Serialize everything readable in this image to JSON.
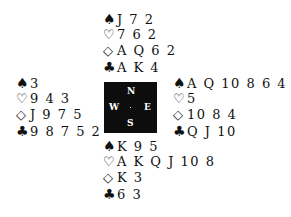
{
  "deal": {
    "north": {
      "spades": "J 7 2",
      "hearts": "7 6 2",
      "diamonds": "A Q 6 2",
      "clubs": "A K 4"
    },
    "west": {
      "spades": "3",
      "hearts": "9 4 3",
      "diamonds": "J 9 7 5",
      "clubs": "9 8 7 5 2"
    },
    "east": {
      "spades": "A Q 10 8 6 4",
      "hearts": "5",
      "diamonds": "10 8 4",
      "clubs": "Q J 10"
    },
    "south": {
      "spades": "K 9 5",
      "hearts": "A K Q J 10 8",
      "diamonds": "K 3",
      "clubs": "6 3"
    }
  },
  "compass": {
    "n": "N",
    "e": "E",
    "s": "S",
    "w": "W"
  },
  "symbols": {
    "spade": "♠",
    "heart": "♡",
    "diamond": "◇",
    "club": "♣"
  }
}
